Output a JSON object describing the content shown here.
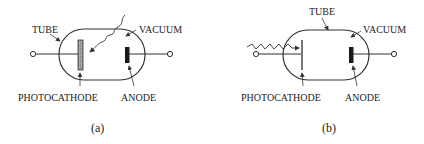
{
  "figure": {
    "panels": [
      {
        "id": "a",
        "caption": "(a)",
        "labels": {
          "tube": "TUBE",
          "vacuum": "VACUUM",
          "photocathode": "PHOTOCATHODE",
          "anode": "ANODE"
        },
        "photocathode_style": "thick-shaded-plate",
        "light_source": "wavy-arrow-from-top"
      },
      {
        "id": "b",
        "caption": "(b)",
        "labels": {
          "tube": "TUBE",
          "vacuum": "VACUUM",
          "photocathode": "PHOTOCATHODE",
          "anode": "ANODE"
        },
        "photocathode_style": "thin-plate",
        "light_source": "wavy-arrow-from-left"
      }
    ],
    "colors": {
      "line": "#333333",
      "photocathode_fill": "#9a9a9a",
      "anode_fill": "#1a1a1a"
    }
  }
}
